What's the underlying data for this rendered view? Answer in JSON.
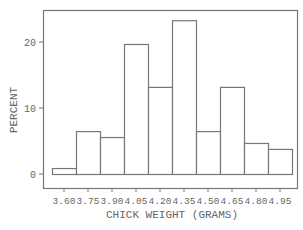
{
  "chart_data": {
    "type": "bar",
    "subtype": "histogram",
    "title": "",
    "xlabel": "CHICK WEIGHT (GRAMS)",
    "ylabel": "PERCENT",
    "categories": [
      "3.60",
      "3.75",
      "3.90",
      "4.05",
      "4.20",
      "4.35",
      "4.50",
      "4.65",
      "4.80",
      "4.95"
    ],
    "values": [
      0.9,
      6.5,
      5.6,
      19.7,
      13.2,
      23.3,
      6.5,
      13.2,
      4.7,
      3.8
    ],
    "yticks": [
      0,
      10,
      20
    ],
    "ylim": [
      -2,
      25
    ],
    "grid": false,
    "legend": null
  },
  "colors": {
    "axis": "#777777",
    "bar_stroke": "#777777",
    "bar_fill": "#ffffff",
    "text": "#666666"
  }
}
